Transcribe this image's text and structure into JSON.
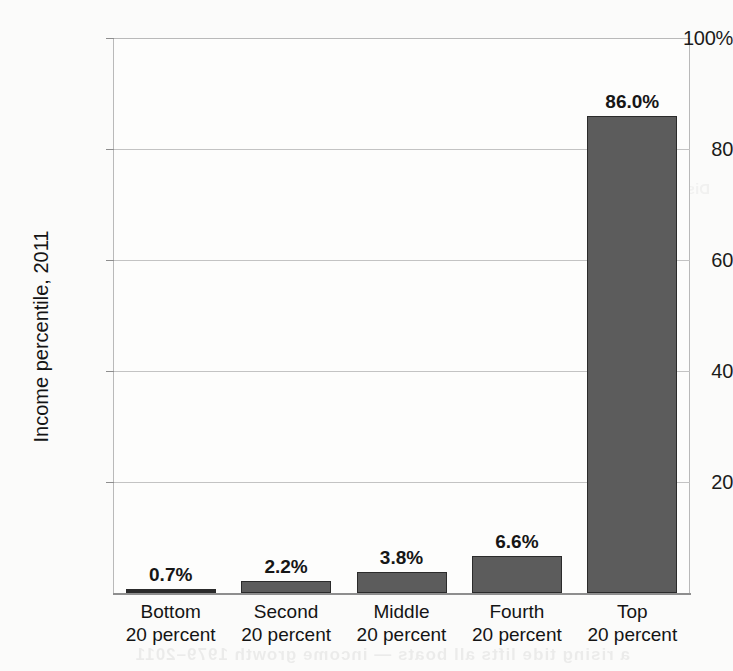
{
  "chart_data": {
    "type": "bar",
    "title": "",
    "xlabel": "",
    "ylabel": "Income percentile, 2011",
    "ylim": [
      0,
      100
    ],
    "grid": true,
    "legend": "none",
    "categories": [
      "Bottom 20 percent",
      "Second 20 percent",
      "Middle 20 percent",
      "Fourth 20 percent",
      "Top 20 percent"
    ],
    "category_lines": [
      [
        "Bottom",
        "20 percent"
      ],
      [
        "Second",
        "20 percent"
      ],
      [
        "Middle",
        "20 percent"
      ],
      [
        "Fourth",
        "20 percent"
      ],
      [
        "Top",
        "20 percent"
      ]
    ],
    "values": [
      0.7,
      2.2,
      3.8,
      6.6,
      86.0
    ],
    "value_labels": [
      "0.7%",
      "2.2%",
      "3.8%",
      "6.6%",
      "86.0%"
    ],
    "ytick_values": [
      100,
      80,
      60,
      40,
      20
    ],
    "ytick_labels": [
      "100%",
      "80",
      "60",
      "40",
      "20"
    ],
    "bar_color": "#5c5c5c",
    "bar_edge_color": "#2b2b2b",
    "grid_color": "#c3c3c3",
    "axis_color": "#8e8e8e",
    "background_color": "#fbfbfa"
  },
  "artifacts": {
    "bleed_text_bottom": "a rising tide lifts all boats — income growth 1979–2011",
    "bleed_text_mid": "Distribution of income gains by household quintile"
  }
}
